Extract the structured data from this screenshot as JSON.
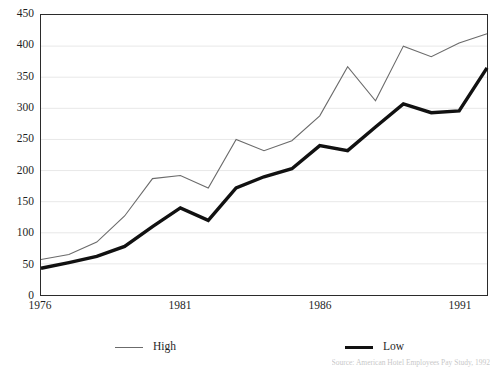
{
  "chart_data": {
    "type": "line",
    "title": "",
    "subtitle": "",
    "xlabel": "",
    "ylabel": "",
    "x": [
      1976,
      1977,
      1978,
      1979,
      1980,
      1981,
      1982,
      1983,
      1984,
      1985,
      1986,
      1987,
      1988,
      1989,
      1990,
      1991,
      1992
    ],
    "categories": [
      "1976",
      "1977",
      "1978",
      "1979",
      "1980",
      "1981",
      "1982",
      "1983",
      "1984",
      "1985",
      "1986",
      "1987",
      "1988",
      "1989",
      "1990",
      "1991",
      "1992"
    ],
    "series": [
      {
        "name": "High",
        "color": "#6b6b6b",
        "line_width": 1.1,
        "values": [
          57,
          65,
          85,
          127,
          187,
          192,
          172,
          250,
          232,
          248,
          288,
          367,
          312,
          400,
          383,
          405,
          420
        ]
      },
      {
        "name": "Low",
        "color": "#111111",
        "line_width": 3.4,
        "values": [
          43,
          52,
          62,
          78,
          110,
          140,
          120,
          172,
          190,
          203,
          240,
          232,
          270,
          307,
          293,
          296,
          365
        ]
      }
    ],
    "ylim": [
      0,
      450
    ],
    "xlim": [
      1976,
      1992
    ],
    "ytick_values": [
      0,
      50,
      100,
      150,
      200,
      250,
      300,
      350,
      400,
      450
    ],
    "ytick_labels": [
      "0",
      "50",
      "100",
      "150",
      "200",
      "250",
      "300",
      "350",
      "400",
      "450"
    ],
    "xtick_values": [
      1976,
      1981,
      1986,
      1991
    ],
    "xtick_labels": [
      "1976",
      "1981",
      "1986",
      "1991"
    ],
    "grid": {
      "horizontal": true,
      "vertical": false,
      "color": "#e8e8e8"
    },
    "legend": {
      "position": "bottom",
      "entries": [
        {
          "label": "High",
          "style": "thin"
        },
        {
          "label": "Low",
          "style": "thick"
        }
      ]
    },
    "plot_border_color": "#2b2b2b",
    "background_color": "#ffffff"
  },
  "source_note": "Source: American Hotel Employees Pay Study, 1992"
}
